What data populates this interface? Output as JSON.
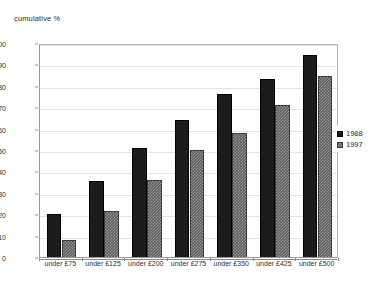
{
  "chart_data": {
    "type": "bar",
    "title": "cumulative %",
    "subtitle": "",
    "xlabel": "",
    "ylabel": "cumulative %",
    "ylim": [
      0,
      100
    ],
    "ytick_step": 10,
    "yticks": [
      0,
      10,
      20,
      30,
      40,
      50,
      60,
      70,
      80,
      90,
      100
    ],
    "ytick_labels": [
      "0",
      "10",
      "20",
      "30",
      "40",
      "50",
      "60",
      "70",
      "80",
      "90",
      "100"
    ],
    "grid": true,
    "grid_axis": "y",
    "legend_position": "right",
    "categories": [
      "under £75",
      "under £125",
      "under £200",
      "under £275",
      "under £350",
      "under £425",
      "under £500"
    ],
    "series": [
      {
        "name": "1988",
        "color": "#1c1c1c",
        "pattern": "solid",
        "values": [
          20,
          35.5,
          51,
          64,
          76,
          83,
          94.5
        ]
      },
      {
        "name": "1997",
        "color": "#5f5f5f",
        "pattern": "checkered",
        "values": [
          8,
          21.5,
          36,
          50,
          58,
          71,
          84.5
        ]
      }
    ]
  },
  "legend": {
    "entries": [
      {
        "label": "1988"
      },
      {
        "label": "1997"
      }
    ]
  },
  "colors": {
    "series_1988": "#1c1c1c",
    "series_1997": "#5f5f5f",
    "gridline": "#e2e2e2",
    "axis": "#8c8c8c",
    "text": "#2f2f2f",
    "background": "#ffffff"
  }
}
